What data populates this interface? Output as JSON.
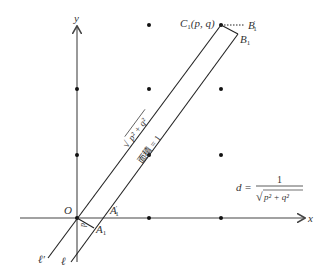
{
  "diagram": {
    "axes": {
      "x_label": "x",
      "y_label": "y",
      "origin_label": "O"
    },
    "points": {
      "C1": {
        "name": "C",
        "sub": "1",
        "coords": "(p, q)"
      },
      "B1": {
        "name": "B",
        "sub": "1"
      },
      "B1p": {
        "name": "B",
        "sub": "1",
        "prime": "′"
      },
      "A1": {
        "name": "A",
        "sub": "1"
      },
      "A1p": {
        "name": "A",
        "sub": "1",
        "prime": "′"
      }
    },
    "lines": {
      "l": "ℓ",
      "lp": "ℓ′"
    },
    "labels": {
      "length": "√(p² + q²)",
      "length_radicand": "p² + q²",
      "area": "面積 = 1",
      "d_small": "d"
    },
    "formula": {
      "lhs": "d =",
      "numerator": "1",
      "denominator": "p² + q²"
    },
    "colors": {
      "axis": "#555555",
      "line": "#222222",
      "dot": "#111111"
    }
  }
}
